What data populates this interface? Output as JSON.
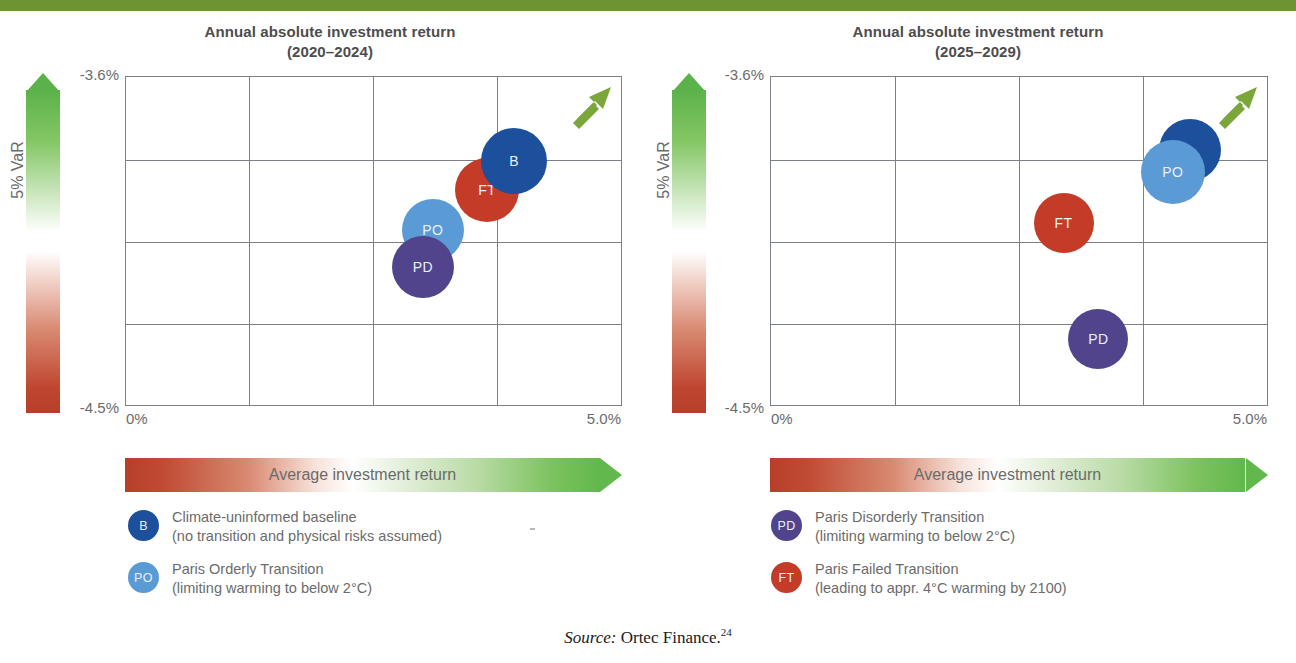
{
  "page": {
    "accent_green": "#6d9333",
    "source_prefix": "Source:",
    "source_text": " Ortec Finance.",
    "source_footnote": "24"
  },
  "chart_data": [
    {
      "type": "scatter",
      "title": "Annual absolute investment return",
      "subtitle": "(2020–2024)",
      "xlabel": "Average investment return",
      "ylabel": "5% VaR",
      "xticks": [
        "0%",
        "5.0%"
      ],
      "yticks": [
        "-3.6%",
        "-4.5%"
      ],
      "xlim": [
        0,
        5.0
      ],
      "ylim": [
        -4.5,
        -3.6
      ],
      "grid": true,
      "grid_cols": 4,
      "grid_rows": 4,
      "annotation": "up-right green arrow (better outcome direction)",
      "points": [
        {
          "code": "B",
          "name": "Climate-uninformed baseline",
          "x": 3.92,
          "y": -3.83,
          "r": 33,
          "color": "#1c4f9c",
          "z": 2
        },
        {
          "code": "FT",
          "name": "Paris Failed Transition",
          "x": 3.65,
          "y": -3.91,
          "r": 32,
          "color": "#c43b28",
          "z": 1
        },
        {
          "code": "PO",
          "name": "Paris Orderly Transition",
          "x": 3.1,
          "y": -4.02,
          "r": 31,
          "color": "#5b9bd5",
          "z": 3
        },
        {
          "code": "PD",
          "name": "Paris Disorderly Transition",
          "x": 3.0,
          "y": -4.12,
          "r": 31,
          "color": "#52448c",
          "z": 4
        }
      ]
    },
    {
      "type": "scatter",
      "title": "Annual absolute investment return",
      "subtitle": "(2025–2029)",
      "xlabel": "Average investment return",
      "ylabel": "5% VaR",
      "xticks": [
        "0%",
        "5.0%"
      ],
      "yticks": [
        "-3.6%",
        "-4.5%"
      ],
      "xlim": [
        0,
        5.0
      ],
      "ylim": [
        -4.5,
        -3.6
      ],
      "grid": true,
      "grid_cols": 4,
      "grid_rows": 4,
      "annotation": "up-right green arrow (better outcome direction)",
      "points": [
        {
          "code": "B",
          "name": "Climate-uninformed baseline",
          "x": 4.22,
          "y": -3.8,
          "r": 31,
          "color": "#1c4f9c",
          "z": 1,
          "label_hidden": true
        },
        {
          "code": "PO",
          "name": "Paris Orderly Transition",
          "x": 4.05,
          "y": -3.86,
          "r": 32,
          "color": "#5b9bd5",
          "z": 2
        },
        {
          "code": "FT",
          "name": "Paris Failed Transition",
          "x": 2.95,
          "y": -4.0,
          "r": 30,
          "color": "#c43b28",
          "z": 3
        },
        {
          "code": "PD",
          "name": "Paris Disorderly Transition",
          "x": 3.3,
          "y": -4.32,
          "r": 30,
          "color": "#52448c",
          "z": 4
        }
      ]
    }
  ],
  "panels": [
    {
      "title": "Annual absolute investment return",
      "subtitle": "(2020–2024)",
      "y_top": "-3.6%",
      "y_bottom": "-4.5%",
      "x_left": "0%",
      "x_right": "5.0%",
      "y_axis_label": "5% VaR",
      "x_axis_label": "Average investment return",
      "legend": [
        {
          "code": "B",
          "color": "#1c4f9c",
          "line1": "Climate-uninformed baseline",
          "line2": "(no transition and physical risks assumed)"
        },
        {
          "code": "PO",
          "color": "#5b9bd5",
          "line1": "Paris Orderly Transition",
          "line2": "(limiting warming to below 2°C)"
        }
      ]
    },
    {
      "title": "Annual absolute investment return",
      "subtitle": "(2025–2029)",
      "y_top": "-3.6%",
      "y_bottom": "-4.5%",
      "x_left": "0%",
      "x_right": "5.0%",
      "y_axis_label": "5% VaR",
      "x_axis_label": "Average investment return",
      "legend": [
        {
          "code": "PD",
          "color": "#52448c",
          "line1": "Paris Disorderly Transition",
          "line2": "(limiting warming to below 2°C)"
        },
        {
          "code": "FT",
          "color": "#c43b28",
          "line1": "Paris Failed Transition",
          "line2": "(leading to appr. 4°C warming by 2100)"
        }
      ]
    }
  ]
}
